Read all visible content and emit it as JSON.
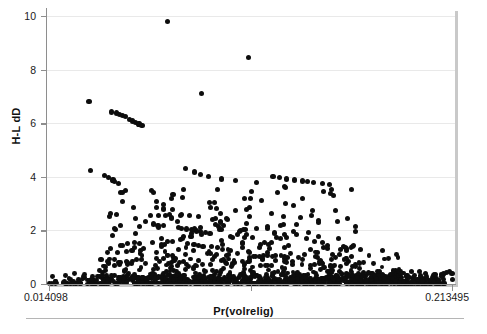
{
  "chart_data": {
    "type": "scatter",
    "title": "",
    "xlabel": "Pr(volrelig)",
    "ylabel": "H-L dD",
    "xlim": [
      0.014098,
      0.213495
    ],
    "ylim": [
      0,
      10
    ],
    "xtick_labels": [
      "0.014098",
      "0.213495"
    ],
    "ytick_labels": [
      "0",
      "2",
      "4",
      "6",
      "8",
      "10"
    ],
    "yticks": [
      0,
      2,
      4,
      6,
      8,
      10
    ],
    "grid": "horizontal",
    "legend": "none",
    "marker": "filled-circle",
    "marker_color": "#0d0d0d",
    "gridline_color": "#e9e9e9",
    "axis_color": "#8e8e8e",
    "points": [
      [
        0.0726,
        9.78
      ],
      [
        0.1128,
        8.45
      ],
      [
        0.0339,
        6.8
      ],
      [
        0.0452,
        6.42
      ],
      [
        0.0475,
        6.38
      ],
      [
        0.0489,
        6.33
      ],
      [
        0.0504,
        6.28
      ],
      [
        0.0519,
        6.24
      ],
      [
        0.0541,
        6.14
      ],
      [
        0.0556,
        6.08
      ],
      [
        0.0571,
        6.02
      ],
      [
        0.0586,
        5.97
      ],
      [
        0.0601,
        5.92
      ],
      [
        0.0896,
        7.12
      ],
      [
        0.0346,
        4.22
      ],
      [
        0.0414,
        4.06
      ],
      [
        0.0436,
        3.97
      ],
      [
        0.0458,
        3.88
      ],
      [
        0.0467,
        3.82
      ],
      [
        0.0483,
        3.76
      ],
      [
        0.0649,
        3.5
      ],
      [
        0.0755,
        3.33
      ],
      [
        0.08,
        3.24
      ],
      [
        0.0709,
        2.8
      ],
      [
        0.0817,
        4.32
      ],
      [
        0.0862,
        4.18
      ],
      [
        0.0892,
        4.1
      ],
      [
        0.093,
        4.02
      ],
      [
        0.0996,
        3.92
      ],
      [
        0.1063,
        3.87
      ],
      [
        0.1168,
        3.8
      ],
      [
        0.1249,
        4.02
      ],
      [
        0.1283,
        3.98
      ],
      [
        0.1318,
        3.92
      ],
      [
        0.1356,
        3.88
      ],
      [
        0.1394,
        3.84
      ],
      [
        0.142,
        3.82
      ],
      [
        0.1451,
        3.8
      ],
      [
        0.1496,
        3.74
      ],
      [
        0.153,
        3.72
      ],
      [
        0.1637,
        3.52
      ],
      [
        0.082,
        2.05
      ],
      [
        0.0848,
        2.02
      ],
      [
        0.087,
        1.98
      ],
      [
        0.0892,
        1.95
      ],
      [
        0.0915,
        1.92
      ],
      [
        0.0938,
        1.88
      ],
      [
        0.0828,
        1.52
      ],
      [
        0.0858,
        1.48
      ],
      [
        0.088,
        1.44
      ],
      [
        0.0903,
        1.4
      ],
      [
        0.0552,
        1.26
      ],
      [
        0.0398,
        0.92
      ],
      [
        0.0435,
        0.78
      ],
      [
        0.0466,
        0.7
      ],
      [
        0.062,
        2.32
      ],
      [
        0.0658,
        2.24
      ],
      [
        0.068,
        2.18
      ],
      [
        0.0567,
        2.45
      ],
      [
        0.059,
        2.15
      ],
      [
        0.0718,
        2.56
      ],
      [
        0.0748,
        2.46
      ],
      [
        0.0782,
        2.12
      ],
      [
        0.0805,
        1.78
      ],
      [
        0.099,
        2.62
      ],
      [
        0.1023,
        2.42
      ],
      [
        0.0963,
        2.22
      ],
      [
        0.0985,
        2.02
      ],
      [
        0.1082,
        1.96
      ],
      [
        0.111,
        1.72
      ],
      [
        0.1222,
        2.08
      ],
      [
        0.1258,
        1.9
      ],
      [
        0.1352,
        1.96
      ],
      [
        0.1415,
        1.7
      ],
      [
        0.1188,
        1.48
      ],
      [
        0.1232,
        1.32
      ],
      [
        0.152,
        1.45
      ],
      [
        0.1585,
        1.28
      ],
      [
        0.1682,
        1.3
      ],
      [
        0.179,
        1.24
      ],
      [
        0.2135,
        0.38
      ]
    ],
    "cloud_description": "very dense near-zero band spanning full x range, thinning upward; several descending arc chains; two high outliers near 9.8 and 8.45"
  },
  "axes": {
    "x_title": "Pr(volrelig)",
    "y_title": "H-L dD",
    "x_min_label": "0.014098",
    "x_max_label": "0.213495",
    "y_labels": [
      "10",
      "8",
      "6",
      "4",
      "2",
      "0"
    ]
  }
}
